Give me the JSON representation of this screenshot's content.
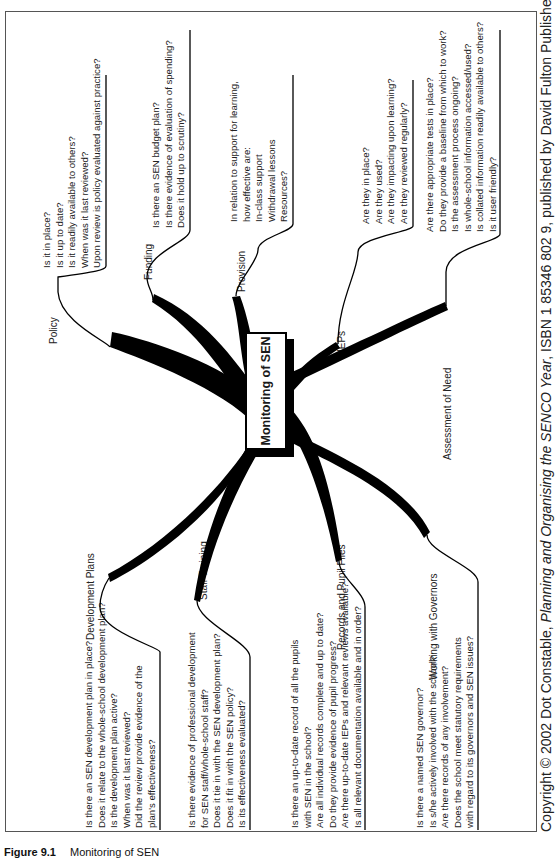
{
  "figure": {
    "caption_number": "Figure 9.1",
    "caption_title": "Monitoring of SEN"
  },
  "center": {
    "title": "Monitoring of SEN"
  },
  "branches": {
    "policy": {
      "label": "Policy",
      "questions": [
        "Is it in place?",
        "Is it up to date?",
        "Is it readily available to others?",
        "When was it last reviewed?",
        "Upon review is policy evaluated against practice?"
      ]
    },
    "funding": {
      "label": "Funding",
      "questions": [
        "Is there an SEN budget plan?",
        "Is there evidence of evaluation of spending?",
        "Does it hold up to scrutiny?"
      ]
    },
    "provision": {
      "label": "Provision",
      "questions": [
        "In relation to support for learning,",
        "how effective are:",
        "In-class support",
        "Withdrawal lessons",
        "Resources?"
      ]
    },
    "ieps": {
      "label": "IEPs",
      "questions": [
        "Are they in place?",
        "Are they used?",
        "Are they impacting upon learning?",
        "Are they reviewed regularly?"
      ]
    },
    "assessment": {
      "label": "Assessment of Need",
      "questions": [
        "Are there appropriate tests in place?",
        "Do they provide a baseline from which to work?",
        "Is the assessment process ongoing?",
        "Is whole-school information accessed/used?",
        "Is collated information readily available to others?",
        "Is it user friendly?"
      ]
    },
    "development": {
      "label": "Development Plans",
      "questions": [
        "Is there an SEN development plan in place?",
        "Does it relate to the whole-school development plan?",
        "Is the development plan active?",
        "When was it last reviewed?",
        "Did the review provide evidence of the",
        "plan's effectiveness?"
      ]
    },
    "staff": {
      "label": "Staff Training",
      "questions": [
        "Is there evidence of professional development",
        "for SEN staff/whole-school staff?",
        "Does it tie in with the SEN development plan?",
        "Does it fit in with the SEN policy?",
        "Is its effectiveness evaluated?"
      ]
    },
    "records": {
      "label": "Records and Pupil Files",
      "questions": [
        "Is there an up-to-date record of all the pupils",
        "with SEN in the school?",
        "Are all individual records complete and up to date?",
        "Do they provide evidence of pupil progress?",
        "Are there up-to-date IEPs and relevant reviews available?",
        "Is all relevant documentation available and in order?"
      ]
    },
    "governors": {
      "label": "Working with Governors",
      "questions": [
        "Is there a named SEN governor?",
        "Is s/he actively involved with the school?",
        "Are there records of any involvement?",
        "Does the school meet statutory requirements",
        "with regard to its governors and SEN issues?"
      ]
    }
  },
  "copyright": {
    "prefix": "Copyright © 2002 Dot Constable, ",
    "title": "Planning and Organising the SENCO Year",
    "suffix": ", ISBN 1 85346 802 9, published by David Fulton Publishers"
  }
}
